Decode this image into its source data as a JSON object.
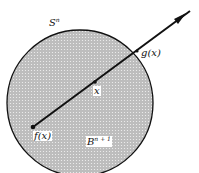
{
  "diagram": {
    "labels": {
      "sphere": "S",
      "sphere_sup": "n",
      "g": "g(x)",
      "x": "x",
      "f": "f(x)",
      "ball": "B",
      "ball_sup": "n + 1"
    },
    "colors": {
      "stroke": "#111111",
      "fill": "#c8c8c8"
    }
  }
}
